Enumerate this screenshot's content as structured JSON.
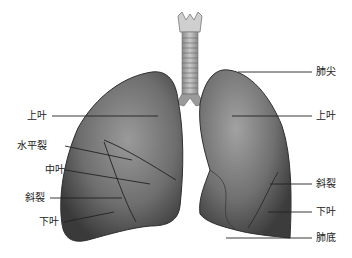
{
  "figure": {
    "labels_left": [
      {
        "id": "upper-lobe-right",
        "text": "上叶",
        "x": 27,
        "y": 111
      },
      {
        "id": "horizontal-fissure",
        "text": "水平裂",
        "x": 27,
        "y": 141
      },
      {
        "id": "middle-lobe",
        "text": "中叶",
        "x": 45,
        "y": 165
      },
      {
        "id": "oblique-fissure-right",
        "text": "斜裂",
        "x": 25,
        "y": 193
      },
      {
        "id": "lower-lobe-right",
        "text": "下叶",
        "x": 39,
        "y": 217
      }
    ],
    "labels_right": [
      {
        "id": "lung-apex",
        "text": "肺尖",
        "x": 316,
        "y": 67
      },
      {
        "id": "upper-lobe-left",
        "text": "上叶",
        "x": 316,
        "y": 111
      },
      {
        "id": "oblique-fissure-left",
        "text": "斜裂",
        "x": 316,
        "y": 179
      },
      {
        "id": "lower-lobe-left",
        "text": "下叶",
        "x": 316,
        "y": 207
      },
      {
        "id": "lung-base",
        "text": "肺底",
        "x": 316,
        "y": 234
      }
    ],
    "colors": {
      "lung_dark": "#4a4a4a",
      "lung_mid": "#7a7a7a",
      "lung_light": "#a8a8a8",
      "trachea": "#b0b0b0",
      "leader_line": "#222222"
    }
  }
}
